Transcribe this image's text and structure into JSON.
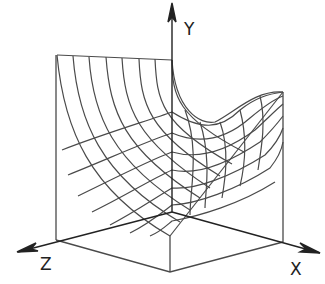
{
  "diagram": {
    "type": "3d-surface-wireframe",
    "axes": {
      "x_label": "X",
      "y_label": "Y",
      "z_label": "Z"
    },
    "colors": {
      "line": "#444444",
      "axis": "#222222",
      "background": "#ffffff"
    }
  }
}
